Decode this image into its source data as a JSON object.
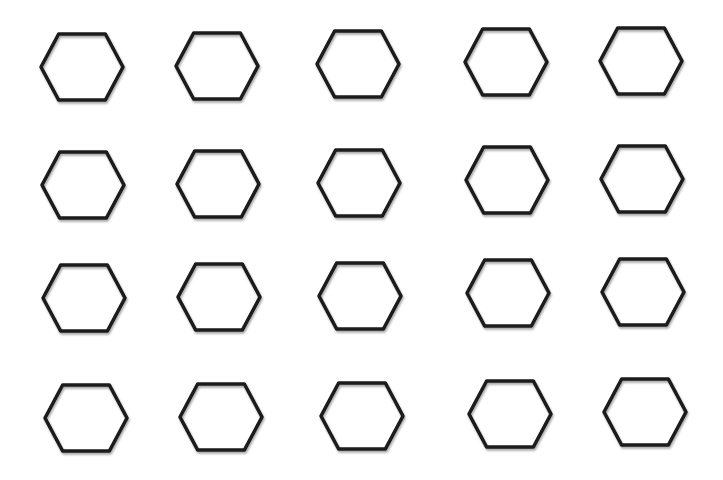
{
  "diagram": {
    "background": "#ffffff",
    "stroke_color": "#1a1a1a",
    "stroke_width": 3.5,
    "shape": "hexagon",
    "hex_half_width": 41,
    "hex_half_height": 33,
    "rows": 4,
    "cols": 5,
    "hexagons": [
      {
        "row": 1,
        "col": 1,
        "cx": 82,
        "cy": 67
      },
      {
        "row": 1,
        "col": 2,
        "cx": 217,
        "cy": 66
      },
      {
        "row": 1,
        "col": 3,
        "cx": 358,
        "cy": 64
      },
      {
        "row": 1,
        "col": 4,
        "cx": 506,
        "cy": 62
      },
      {
        "row": 1,
        "col": 5,
        "cx": 641,
        "cy": 61
      },
      {
        "row": 2,
        "col": 1,
        "cx": 83,
        "cy": 185
      },
      {
        "row": 2,
        "col": 2,
        "cx": 218,
        "cy": 184
      },
      {
        "row": 2,
        "col": 3,
        "cx": 359,
        "cy": 183
      },
      {
        "row": 2,
        "col": 4,
        "cx": 507,
        "cy": 180
      },
      {
        "row": 2,
        "col": 5,
        "cx": 642,
        "cy": 179
      },
      {
        "row": 3,
        "col": 1,
        "cx": 84,
        "cy": 298
      },
      {
        "row": 3,
        "col": 2,
        "cx": 219,
        "cy": 297
      },
      {
        "row": 3,
        "col": 3,
        "cx": 360,
        "cy": 296
      },
      {
        "row": 3,
        "col": 4,
        "cx": 508,
        "cy": 293
      },
      {
        "row": 3,
        "col": 5,
        "cx": 643,
        "cy": 292
      },
      {
        "row": 4,
        "col": 1,
        "cx": 86,
        "cy": 418
      },
      {
        "row": 4,
        "col": 2,
        "cx": 221,
        "cy": 417
      },
      {
        "row": 4,
        "col": 3,
        "cx": 362,
        "cy": 416
      },
      {
        "row": 4,
        "col": 4,
        "cx": 510,
        "cy": 414
      },
      {
        "row": 4,
        "col": 5,
        "cx": 645,
        "cy": 412
      }
    ]
  }
}
